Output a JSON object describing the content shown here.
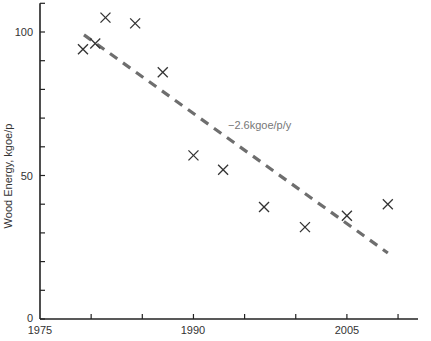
{
  "chart_data": {
    "type": "scatter",
    "title": "",
    "xlabel": "",
    "ylabel": "Wood Energy, kgoe/p",
    "xlim": [
      1975,
      2011
    ],
    "ylim": [
      0,
      110
    ],
    "x_ticks_labeled": [
      1975,
      1990,
      2005
    ],
    "x_ticks_minor_step": 5,
    "y_ticks_labeled": [
      0,
      50,
      100
    ],
    "y_ticks_minor_step": 10,
    "grid": false,
    "legend": null,
    "series": [
      {
        "name": "observations",
        "marker": "x",
        "color": "#333333",
        "points": [
          {
            "x": 1979.2,
            "y": 94
          },
          {
            "x": 1980.4,
            "y": 96
          },
          {
            "x": 1981.4,
            "y": 105
          },
          {
            "x": 1984.3,
            "y": 103
          },
          {
            "x": 1987.0,
            "y": 86
          },
          {
            "x": 1990.0,
            "y": 57
          },
          {
            "x": 1992.9,
            "y": 52
          },
          {
            "x": 1996.9,
            "y": 39
          },
          {
            "x": 2000.9,
            "y": 32
          },
          {
            "x": 2005.0,
            "y": 36
          },
          {
            "x": 2009.0,
            "y": 40
          }
        ]
      },
      {
        "name": "trend",
        "type": "line",
        "style": "dashed",
        "color": "#6e6e6e",
        "points": [
          {
            "x": 1979.3,
            "y": 99
          },
          {
            "x": 2009.0,
            "y": 23
          }
        ]
      }
    ],
    "annotations": [
      {
        "text": "−2.6kgoe/p/y",
        "x": 1994.0,
        "y": 67
      }
    ]
  },
  "labels": {
    "ylabel": "Wood Energy, kgoe/p",
    "trend_annotation": "−2.6kgoe/p/y",
    "x_tick_1975": "1975",
    "x_tick_1990": "1990",
    "x_tick_2005": "2005",
    "y_tick_0": "0",
    "y_tick_50": "50",
    "y_tick_100": "100"
  }
}
